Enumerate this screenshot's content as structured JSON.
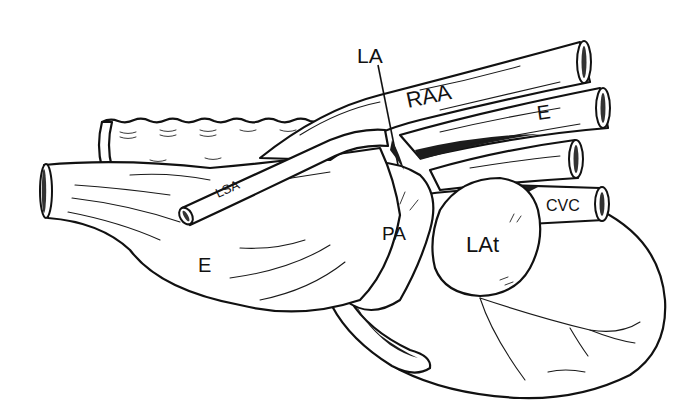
{
  "figure": {
    "type": "anatomical line drawing",
    "colors": {
      "ink": "#111111",
      "background": "#ffffff"
    },
    "labels": [
      {
        "id": "la",
        "text": "LA",
        "x": 357,
        "y": 63,
        "size": 21,
        "rotate": 0
      },
      {
        "id": "raa",
        "text": "RAA",
        "x": 408,
        "y": 108,
        "size": 22,
        "rotate": -12
      },
      {
        "id": "e_upper",
        "text": "E",
        "x": 538,
        "y": 120,
        "size": 20,
        "rotate": -8
      },
      {
        "id": "lsa",
        "text": "LSA",
        "x": 218,
        "y": 198,
        "size": 13,
        "rotate": -24
      },
      {
        "id": "pa",
        "text": "PA",
        "x": 382,
        "y": 240,
        "size": 19,
        "rotate": 0
      },
      {
        "id": "lat",
        "text": "LAt",
        "x": 466,
        "y": 252,
        "size": 22,
        "rotate": 0
      },
      {
        "id": "cvc",
        "text": "CVC",
        "x": 546,
        "y": 211,
        "size": 16,
        "rotate": 0
      },
      {
        "id": "e_lower",
        "text": "E",
        "x": 198,
        "y": 272,
        "size": 20,
        "rotate": 0
      }
    ]
  }
}
